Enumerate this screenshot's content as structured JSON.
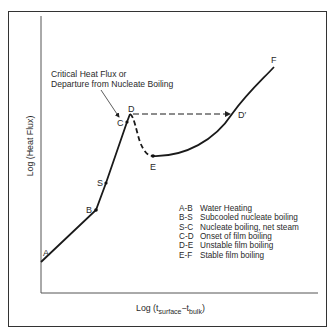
{
  "diagram": {
    "annotation": {
      "line1": "Critical Heat Flux or",
      "line2": "Departure from Nucleate Boiling"
    },
    "axes": {
      "y_label": "Log (Heat Flux)",
      "x_label": {
        "prefix": "Log (t",
        "sub1": "surface",
        "mid": "−t",
        "sub2": "bulk",
        "suffix": ")"
      }
    },
    "points": {
      "A": "A",
      "B": "B",
      "S": "S",
      "C": "C",
      "D": "D",
      "E": "E",
      "F": "F",
      "Dprime": "D′"
    },
    "legend": [
      {
        "code": "A-B",
        "desc": "Water Heating"
      },
      {
        "code": "B-S",
        "desc": "Subcooled nucleate boiling"
      },
      {
        "code": "S-C",
        "desc": "Nucleate boiling, net steam"
      },
      {
        "code": "C-D",
        "desc": "Onset of film boiling"
      },
      {
        "code": "D-E",
        "desc": "Unstable film boiling"
      },
      {
        "code": "E-F",
        "desc": "Stable film boiling"
      }
    ],
    "colors": {
      "line": "#1a1a1a",
      "text": "#2a2a2a",
      "axis": "#555555"
    }
  }
}
